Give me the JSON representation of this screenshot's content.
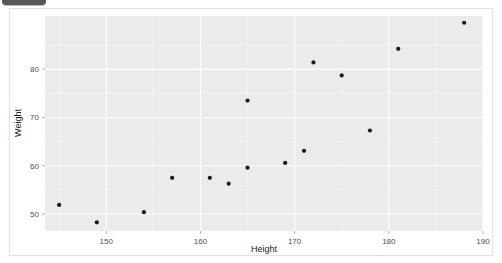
{
  "window": {
    "top_chip_label": ""
  },
  "chart_data": {
    "type": "scatter",
    "title": "",
    "xlabel": "Height",
    "ylabel": "Weight",
    "xlim": [
      143.5,
      190.0
    ],
    "ylim": [
      46.5,
      91.0
    ],
    "xticks": [
      150,
      160,
      170,
      180,
      190
    ],
    "yticks": [
      50,
      60,
      70,
      80
    ],
    "xtick_labels": [
      "150",
      "160",
      "170",
      "180",
      "190"
    ],
    "ytick_labels": [
      "50",
      "60",
      "70",
      "80"
    ],
    "grid": true,
    "legend": null,
    "panel_color": "#ebebeb",
    "grid_color": "#ffffff",
    "point_color": "#1a1a1a",
    "x": [
      145,
      149,
      154,
      157,
      161,
      163,
      165,
      165,
      169,
      171,
      172,
      175,
      178,
      181,
      188
    ],
    "y": [
      51.9,
      48.3,
      50.4,
      57.5,
      57.5,
      56.3,
      59.6,
      73.5,
      60.6,
      63.1,
      81.4,
      78.7,
      67.3,
      84.2,
      89.6
    ],
    "points": [
      {
        "height": 145,
        "weight": 51.9
      },
      {
        "height": 149,
        "weight": 48.3
      },
      {
        "height": 154,
        "weight": 50.4
      },
      {
        "height": 157,
        "weight": 57.5
      },
      {
        "height": 161,
        "weight": 57.5
      },
      {
        "height": 163,
        "weight": 56.3
      },
      {
        "height": 165,
        "weight": 59.6
      },
      {
        "height": 165,
        "weight": 73.5
      },
      {
        "height": 169,
        "weight": 60.6
      },
      {
        "height": 171,
        "weight": 63.1
      },
      {
        "height": 172,
        "weight": 81.4
      },
      {
        "height": 175,
        "weight": 78.7
      },
      {
        "height": 178,
        "weight": 67.3
      },
      {
        "height": 181,
        "weight": 84.2
      },
      {
        "height": 188,
        "weight": 89.6
      }
    ]
  }
}
